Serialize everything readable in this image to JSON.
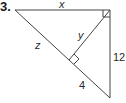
{
  "problem": {
    "number": "3."
  },
  "labels": {
    "top_side": "x",
    "altitude": "y",
    "hyp_upper": "z",
    "right_side": "12",
    "hyp_lower": "4"
  },
  "colors": {
    "stroke": "#444444",
    "text": "#2a2a2a",
    "background": "#ffffff"
  },
  "geometry": {
    "vertices": {
      "A": [
        15,
        10
      ],
      "B": [
        110,
        10
      ],
      "C": [
        110,
        98
      ]
    },
    "altitude_foot": [
      70,
      62
    ],
    "right_angle_marks": [
      "B",
      "foot"
    ]
  }
}
